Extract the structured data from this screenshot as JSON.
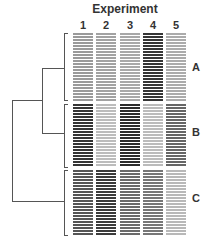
{
  "title": "Experiment",
  "columns": [
    "1",
    "2",
    "3",
    "4",
    "5"
  ],
  "clusters": [
    {
      "label": "A",
      "rows": 23,
      "top": 33,
      "colors": [
        "#9a9a9a",
        "#a2a2a2",
        "#a8a8a8",
        "#363636",
        "#ababab"
      ]
    },
    {
      "label": "B",
      "rows": 21,
      "top": 104,
      "colors": [
        "#353535",
        "#bcbcbc",
        "#2c2c2c",
        "#bbbbbb",
        "#666666"
      ]
    },
    {
      "label": "C",
      "rows": 22,
      "top": 170,
      "colors": [
        "#555555",
        "#3b3b3b",
        "#6a6a6a",
        "#777777",
        "#b8b8b8"
      ]
    }
  ],
  "chart_data": {
    "type": "heatmap",
    "title": "Experiment",
    "columns": [
      "1",
      "2",
      "3",
      "4",
      "5"
    ],
    "row_clusters": [
      {
        "name": "A",
        "row_count": 23,
        "relative_intensity": [
          0.35,
          0.32,
          0.3,
          0.85,
          0.3
        ]
      },
      {
        "name": "B",
        "row_count": 21,
        "relative_intensity": [
          0.85,
          0.2,
          0.9,
          0.2,
          0.6
        ]
      },
      {
        "name": "C",
        "row_count": 22,
        "relative_intensity": [
          0.7,
          0.8,
          0.6,
          0.55,
          0.25
        ]
      }
    ],
    "dendrogram": "((A,B),C)"
  }
}
